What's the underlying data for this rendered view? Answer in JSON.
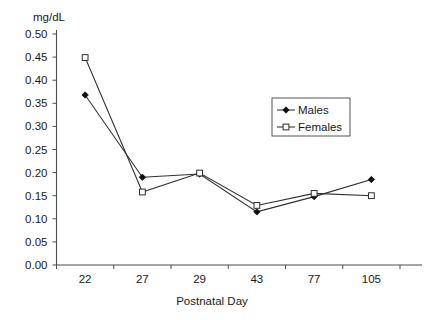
{
  "chart_data": {
    "type": "line",
    "title": "",
    "subtitle": "",
    "xlabel": "Postnatal Day",
    "ylabel": "mg/dL",
    "y_unit_label": "mg/dL",
    "categories": [
      "22",
      "27",
      "29",
      "43",
      "77",
      "105"
    ],
    "ylim": [
      0.0,
      0.5
    ],
    "ytick_step": 0.05,
    "ytick_labels": [
      "0.00",
      "0.05",
      "0.10",
      "0.15",
      "0.20",
      "0.25",
      "0.30",
      "0.35",
      "0.40",
      "0.45",
      "0.50"
    ],
    "ytick_values": [
      0.0,
      0.05,
      0.1,
      0.15,
      0.2,
      0.25,
      0.3,
      0.35,
      0.4,
      0.45,
      0.5
    ],
    "grid": false,
    "legend_position": "inside-upper-right",
    "series": [
      {
        "name": "Males",
        "marker": "filled-diamond",
        "values": [
          0.368,
          0.19,
          0.197,
          0.115,
          0.148,
          0.185
        ]
      },
      {
        "name": "Females",
        "marker": "open-square",
        "values": [
          0.449,
          0.158,
          0.199,
          0.129,
          0.155,
          0.15
        ]
      }
    ]
  },
  "legend": {
    "entries": [
      {
        "label": "Males"
      },
      {
        "label": "Females"
      }
    ]
  },
  "colors": {
    "line": "#303030",
    "axis": "#4d4d4d",
    "text": "#1a1a1a",
    "background": "#ffffff"
  }
}
